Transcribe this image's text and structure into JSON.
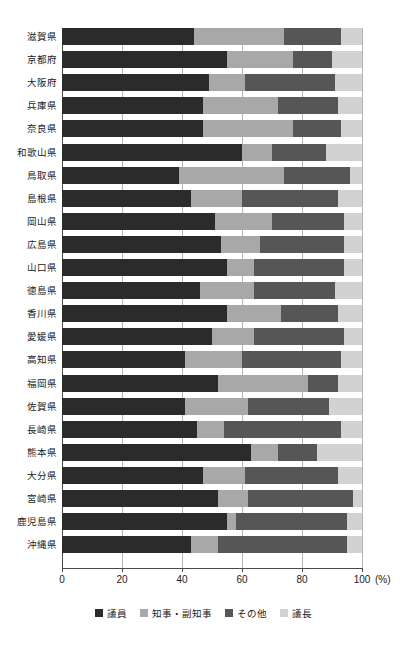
{
  "chart_data": {
    "type": "bar",
    "orientation": "horizontal",
    "stacked": true,
    "normalized_percent": true,
    "title": "",
    "subtitle": "",
    "xlabel": "(%)",
    "ylabel": "",
    "xlim": [
      0,
      100
    ],
    "xticks": [
      0,
      20,
      40,
      60,
      80,
      100
    ],
    "xtick_labels": [
      "0",
      "20",
      "40",
      "60",
      "80",
      "100"
    ],
    "x_unit_label": "(%)",
    "grid": true,
    "grid_axis": "x",
    "legend_position": "bottom",
    "categories": [
      "滋賀県",
      "京都府",
      "大阪府",
      "兵庫県",
      "奈良県",
      "和歌山県",
      "鳥取県",
      "島根県",
      "岡山県",
      "広島県",
      "山口県",
      "徳島県",
      "香川県",
      "愛媛県",
      "高知県",
      "福岡県",
      "佐賀県",
      "長崎県",
      "熊本県",
      "大分県",
      "宮崎県",
      "鹿児島県",
      "沖縄県"
    ],
    "series": [
      {
        "name": "議員",
        "color": "#2b2b2b",
        "values": [
          44,
          55,
          49,
          47,
          47,
          60,
          39,
          43,
          51,
          53,
          55,
          46,
          55,
          50,
          41,
          52,
          41,
          45,
          63,
          47,
          52,
          55,
          43
        ]
      },
      {
        "name": "知事・副知事",
        "color": "#a8a8a8",
        "values": [
          30,
          22,
          12,
          25,
          30,
          10,
          35,
          17,
          19,
          13,
          9,
          18,
          18,
          14,
          19,
          30,
          21,
          9,
          9,
          14,
          10,
          3,
          9
        ]
      },
      {
        "name": "その他",
        "color": "#565656",
        "values": [
          19,
          13,
          30,
          20,
          16,
          18,
          22,
          32,
          24,
          28,
          30,
          27,
          19,
          30,
          33,
          10,
          27,
          39,
          13,
          31,
          35,
          37,
          43
        ]
      },
      {
        "name": "議長",
        "color": "#d2d2d2",
        "values": [
          7,
          10,
          9,
          8,
          7,
          12,
          4,
          8,
          6,
          6,
          6,
          9,
          8,
          6,
          7,
          8,
          11,
          7,
          15,
          8,
          3,
          5,
          5
        ]
      }
    ]
  },
  "legend": {
    "items": [
      {
        "label": "議員",
        "color": "#2b2b2b"
      },
      {
        "label": "知事・副知事",
        "color": "#a8a8a8"
      },
      {
        "label": "その他",
        "color": "#565656"
      },
      {
        "label": "議長",
        "color": "#d2d2d2"
      }
    ]
  }
}
